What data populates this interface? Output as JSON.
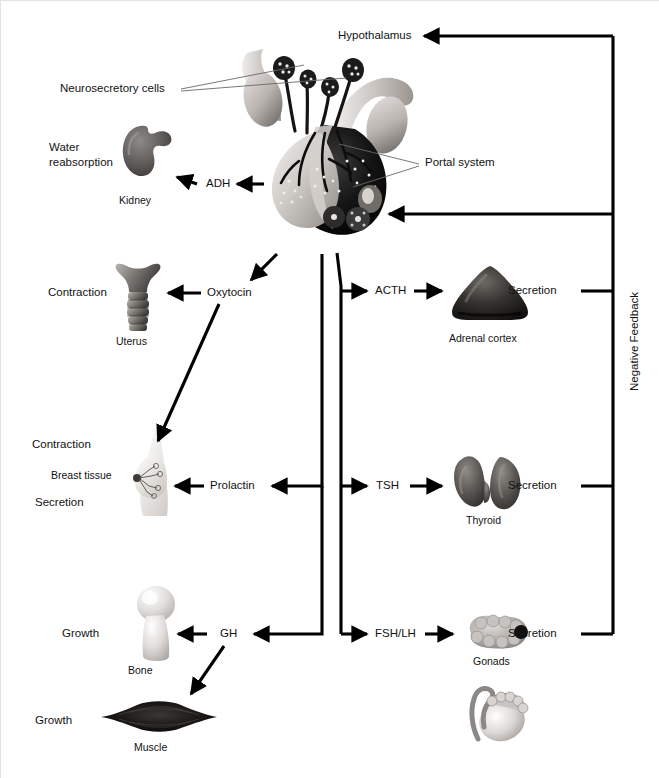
{
  "diagram": {
    "background": "#ffffff",
    "line_color": "#000000"
  },
  "nodes": {
    "hypothalamus": "Hypothalamus",
    "neurosecretory_cells": "Neurosecretory cells",
    "portal_system": "Portal system",
    "negative_feedback": "Negative Feedback"
  },
  "hormones": {
    "adh": "ADH",
    "oxytocin": "Oxytocin",
    "prolactin": "Prolactin",
    "gh": "GH",
    "acth": "ACTH",
    "tsh": "TSH",
    "fsh_lh": "FSH/LH"
  },
  "organs": {
    "kidney": "Kidney",
    "uterus": "Uterus",
    "breast_tissue": "Breast tissue",
    "bone": "Bone",
    "muscle": "Muscle",
    "adrenal_cortex": "Adrenal cortex",
    "thyroid": "Thyroid",
    "gonads": "Gonads"
  },
  "effects": {
    "water_reabsorption_line1": "Water",
    "water_reabsorption_line2": "reabsorption",
    "uterus_contraction": "Contraction",
    "breast_contraction": "Contraction",
    "breast_secretion": "Secretion",
    "bone_growth": "Growth",
    "muscle_growth": "Growth",
    "adrenal_secretion": "Secretion",
    "thyroid_secretion": "Secretion",
    "gonad_secretion": "Secretion"
  }
}
